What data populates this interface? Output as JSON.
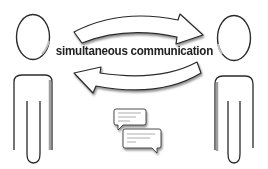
{
  "diagram": {
    "title": "simultaneous communication",
    "nodes": [
      {
        "id": "person-left",
        "label": "",
        "shape": "stick-figure"
      },
      {
        "id": "person-right",
        "label": "",
        "shape": "stick-figure"
      }
    ],
    "edges": [
      {
        "from": "person-left",
        "to": "person-right",
        "shape": "curved-arrow",
        "direction": "right"
      },
      {
        "from": "person-right",
        "to": "person-left",
        "shape": "curved-arrow",
        "direction": "left"
      }
    ],
    "bubbles": [
      {
        "id": "chat-bubble-1",
        "text": "",
        "note": "illegible scribble text"
      },
      {
        "id": "chat-bubble-2",
        "text": "",
        "note": "illegible scribble text"
      }
    ],
    "colors": {
      "stroke": "#222222",
      "shadow": "#9a9a9a",
      "fill": "#ffffff",
      "background": "#ffffff"
    }
  }
}
